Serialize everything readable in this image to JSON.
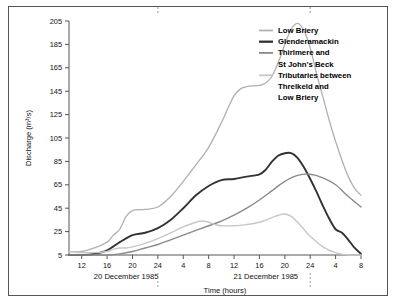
{
  "chart_data": {
    "type": "line",
    "title": "",
    "xlabel": "Time (hours)",
    "ylabel": "Discharge (m³/s)",
    "ylim": [
      5,
      205
    ],
    "yticks": [
      5,
      25,
      45,
      65,
      85,
      105,
      125,
      145,
      165,
      185,
      205
    ],
    "xlim": [
      10,
      56
    ],
    "xticks": [
      12,
      16,
      20,
      24,
      28,
      32,
      36,
      40,
      44,
      48,
      52,
      56
    ],
    "xticklabels": [
      "12",
      "16",
      "20",
      "24",
      "4",
      "8",
      "12",
      "16",
      "20",
      "24",
      "4",
      "8"
    ],
    "grid": false,
    "legend_position": "top-right",
    "day_labels": [
      {
        "text": "20 December 1985",
        "at_hour": 19
      },
      {
        "text": "21 December 1985",
        "at_hour": 41
      }
    ],
    "day_boundary_markers": [
      24,
      48
    ],
    "series": [
      {
        "name": "Low Briery",
        "color": "#b0b0b0",
        "width": 1.3,
        "x": [
          10,
          12,
          14,
          16,
          17,
          18,
          19,
          20,
          22,
          24,
          26,
          28,
          30,
          32,
          34,
          35,
          36,
          37,
          38,
          40,
          41,
          42,
          43,
          44,
          45,
          46,
          47,
          48,
          49,
          50,
          51,
          52,
          53,
          54,
          55,
          56
        ],
        "y": [
          8,
          8,
          11,
          16,
          22,
          27,
          38,
          43,
          44,
          46,
          55,
          68,
          82,
          97,
          118,
          130,
          141,
          147,
          149,
          150,
          152,
          158,
          170,
          185,
          198,
          203,
          197,
          182,
          160,
          140,
          120,
          102,
          86,
          72,
          62,
          56
        ]
      },
      {
        "name": "Glenderamackin",
        "color": "#333333",
        "width": 1.9,
        "x": [
          10,
          12,
          14,
          16,
          18,
          20,
          22,
          24,
          26,
          28,
          30,
          32,
          34,
          36,
          38,
          40,
          41,
          42,
          43,
          44,
          45,
          46,
          47,
          48,
          49,
          50,
          51,
          52,
          53,
          54,
          55,
          56
        ],
        "y": [
          5,
          5,
          6,
          9,
          16,
          22,
          24,
          28,
          35,
          45,
          56,
          64,
          69,
          70,
          72,
          74,
          78,
          85,
          90,
          92,
          92,
          88,
          80,
          70,
          59,
          47,
          36,
          27,
          24,
          18,
          11,
          6
        ]
      },
      {
        "name": "Thirlmere and St John's Beck",
        "color": "#8a8a8a",
        "width": 1.4,
        "x": [
          10,
          12,
          14,
          16,
          18,
          20,
          22,
          24,
          26,
          28,
          30,
          32,
          34,
          36,
          38,
          40,
          42,
          44,
          46,
          48,
          50,
          52,
          54,
          56
        ],
        "y": [
          5,
          5,
          5,
          5,
          6,
          8,
          11,
          14,
          18,
          22,
          26,
          30,
          34,
          39,
          45,
          52,
          60,
          68,
          73,
          74,
          71,
          65,
          55,
          46
        ]
      },
      {
        "name": "Tributaries between Threlkeld and Low Briery",
        "color": "#c8c8c8",
        "width": 1.4,
        "x": [
          10,
          12,
          14,
          16,
          17,
          18,
          19,
          20,
          22,
          24,
          26,
          28,
          30,
          31,
          32,
          33,
          34,
          36,
          38,
          40,
          42,
          43,
          44,
          45,
          46,
          47,
          48,
          50,
          52,
          54,
          56
        ],
        "y": [
          8,
          7,
          7,
          8,
          10,
          11,
          11,
          12,
          15,
          19,
          24,
          29,
          33,
          34,
          33,
          31,
          30,
          30,
          31,
          33,
          37,
          39,
          40,
          38,
          33,
          27,
          21,
          12,
          7,
          5,
          5
        ]
      }
    ]
  },
  "legend": {
    "items": [
      {
        "label_line1": "Low Briery",
        "label_line2": "",
        "label_line3": ""
      },
      {
        "label_line1": "Glenderamackin",
        "label_line2": "",
        "label_line3": ""
      },
      {
        "label_line1": "Thirlmere and",
        "label_line2": "St John's Beck",
        "label_line3": ""
      },
      {
        "label_line1": "Tributaries between",
        "label_line2": "Threlkeld and",
        "label_line3": "Low Briery"
      }
    ]
  }
}
